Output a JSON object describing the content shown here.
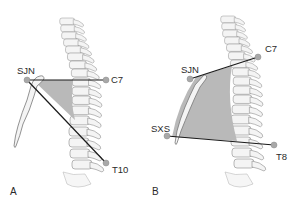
{
  "figure": {
    "panels": [
      {
        "id": "A",
        "label": "A",
        "landmarks": [
          {
            "name": "SJN",
            "label": "SJN"
          },
          {
            "name": "C7",
            "label": "C7"
          },
          {
            "name": "T10",
            "label": "T10"
          }
        ]
      },
      {
        "id": "B",
        "label": "B",
        "landmarks": [
          {
            "name": "SJN",
            "label": "SJN"
          },
          {
            "name": "C7",
            "label": "C7"
          },
          {
            "name": "SXS",
            "label": "SXS"
          },
          {
            "name": "T8",
            "label": "T8"
          }
        ]
      }
    ],
    "colors": {
      "shaded_region": "#b9b9b9",
      "line": "#1a1a1a",
      "landmark_dot": "#a8a8a8",
      "bone_fill": "#f4f4f4",
      "bone_outline": "#8a8a8a"
    }
  }
}
